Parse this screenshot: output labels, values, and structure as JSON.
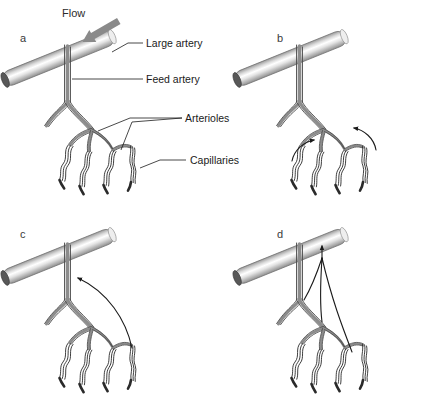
{
  "figure": {
    "background_color": "#ffffff",
    "width": 431,
    "height": 406,
    "panel_count": 4
  },
  "flow": {
    "label": "Flow",
    "direction": "down-left",
    "arrow_color": "#8a8a8a"
  },
  "callouts": [
    {
      "id": "large-artery",
      "label": "Large artery",
      "x": 146,
      "y": 47
    },
    {
      "id": "feed-artery",
      "label": "Feed artery",
      "x": 146,
      "y": 79
    },
    {
      "id": "arterioles",
      "label": "Arterioles",
      "x": 185,
      "y": 122
    },
    {
      "id": "capillaries",
      "label": "Capillaries",
      "x": 190,
      "y": 163
    }
  ],
  "panels": [
    {
      "id": "panel-a",
      "letter": "a",
      "letter_x": 20,
      "letter_y": 42,
      "has_labels": true,
      "has_flow_arrow": true,
      "signal_arrows": 0,
      "description": "Labeled reference network: large artery, feed artery, arterioles, capillaries"
    },
    {
      "id": "panel-b",
      "letter": "b",
      "letter_x": 277,
      "letter_y": 42,
      "has_labels": false,
      "has_flow_arrow": false,
      "signal_arrows": 2,
      "description": "Two short curved arrows at distal arteriole branch points"
    },
    {
      "id": "panel-c",
      "letter": "c",
      "letter_x": 20,
      "letter_y": 236,
      "has_labels": false,
      "has_flow_arrow": false,
      "signal_arrows": 1,
      "description": "Single long curved arrow ascending to the feed artery"
    },
    {
      "id": "panel-d",
      "letter": "d",
      "letter_x": 277,
      "letter_y": 236,
      "has_labels": false,
      "has_flow_arrow": false,
      "signal_arrows": 1,
      "description": "Multiple converging lines merging into one arrow reaching the large artery"
    }
  ],
  "colors": {
    "vessel_outline": "#4a4a4a",
    "vessel_band": "#8c8c8c",
    "capillary": "#2a2a2a",
    "artery_highlight": "#ffffff",
    "artery_shadow": "#8f8f8f",
    "artery_cap": "#555555",
    "label_text": "#1a1a1a",
    "panel_letter": "#3a3a3a",
    "flow_arrow": "#8a8a8a",
    "bottom_rule": "#b9bcc4"
  },
  "bottom_rule": {
    "present": true,
    "y": 382,
    "color": "#b9bcc4"
  }
}
